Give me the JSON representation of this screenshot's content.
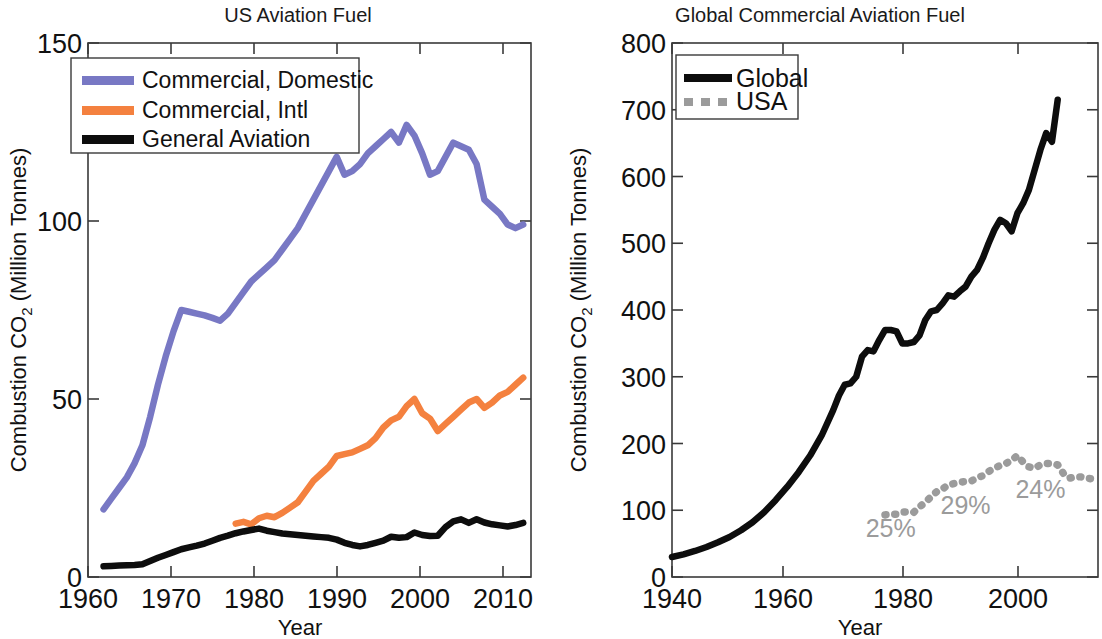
{
  "chart_data": [
    {
      "type": "line",
      "id": "us-aviation-fuel",
      "title": "US Aviation Fuel",
      "xlabel": "Year",
      "ylabel_main": "Combustion CO",
      "ylabel_sub": "2",
      "ylabel_tail": " (Million Tonnes)",
      "ylabel_full": "Combustion CO2 (Million Tonnes)",
      "xlim": [
        1958,
        2015
      ],
      "ylim": [
        0,
        150
      ],
      "xticks": [
        1960,
        1970,
        1980,
        1990,
        2000,
        2010
      ],
      "xticklabels": [
        "1960",
        "1970",
        "1980",
        "1990",
        "2000",
        "2010"
      ],
      "yticks": [
        0,
        50,
        100,
        150
      ],
      "yticklabels": [
        "0",
        "50",
        "100",
        "150"
      ],
      "grid": false,
      "legend_position": "top-left",
      "series": [
        {
          "name": "Commercial, Domestic",
          "color": "#7878c4",
          "style": "solid",
          "x": [
            1960,
            1961,
            1962,
            1963,
            1964,
            1965,
            1966,
            1967,
            1968,
            1969,
            1970,
            1971,
            1972,
            1973,
            1974,
            1975,
            1976,
            1977,
            1978,
            1979,
            1980,
            1981,
            1982,
            1983,
            1984,
            1985,
            1986,
            1987,
            1988,
            1989,
            1990,
            1991,
            1992,
            1993,
            1994,
            1995,
            1996,
            1997,
            1998,
            1999,
            2000,
            2001,
            2002,
            2003,
            2004,
            2005,
            2006,
            2007,
            2008,
            2009,
            2010,
            2011,
            2012,
            2013,
            2014
          ],
          "values": [
            19,
            22,
            25,
            28,
            32,
            37,
            45,
            54,
            62,
            69,
            75,
            74.5,
            74,
            73.5,
            72.8,
            72,
            74,
            77,
            80,
            83,
            85,
            87,
            89,
            92,
            95,
            98,
            102,
            106,
            110,
            114,
            118,
            113,
            114,
            116,
            119,
            121,
            123,
            125,
            122,
            127,
            124,
            119,
            113,
            114,
            118,
            122,
            121,
            120,
            116,
            106,
            104,
            102,
            99,
            98,
            99
          ]
        },
        {
          "name": "Commercial, Intl",
          "color": "#f4813f",
          "style": "solid",
          "x": [
            1977,
            1978,
            1979,
            1980,
            1981,
            1982,
            1983,
            1984,
            1985,
            1986,
            1987,
            1988,
            1989,
            1990,
            1991,
            1992,
            1993,
            1994,
            1995,
            1996,
            1997,
            1998,
            1999,
            2000,
            2001,
            2002,
            2003,
            2004,
            2005,
            2006,
            2007,
            2008,
            2009,
            2010,
            2011,
            2012,
            2013,
            2014
          ],
          "values": [
            15,
            15.5,
            14.8,
            16.5,
            17.2,
            16.8,
            18,
            19.5,
            21,
            24,
            27,
            29,
            31,
            34,
            34.5,
            35,
            36,
            37,
            39,
            42,
            44,
            45,
            48,
            50,
            46,
            44.5,
            41,
            43,
            45,
            47,
            49,
            50,
            47.5,
            49,
            51,
            52,
            54,
            56
          ]
        },
        {
          "name": "General Aviation",
          "color": "#0d0d0d",
          "style": "solid",
          "x": [
            1960,
            1961,
            1962,
            1963,
            1964,
            1965,
            1966,
            1967,
            1968,
            1969,
            1970,
            1971,
            1972,
            1973,
            1974,
            1975,
            1976,
            1977,
            1978,
            1979,
            1980,
            1981,
            1982,
            1983,
            1984,
            1985,
            1986,
            1987,
            1988,
            1989,
            1990,
            1991,
            1992,
            1993,
            1994,
            1995,
            1996,
            1997,
            1998,
            1999,
            2000,
            2001,
            2002,
            2003,
            2004,
            2005,
            2006,
            2007,
            2008,
            2009,
            2010,
            2011,
            2012,
            2013,
            2014
          ],
          "values": [
            3,
            3.1,
            3.2,
            3.3,
            3.4,
            3.6,
            4.5,
            5.4,
            6.2,
            7,
            7.8,
            8.3,
            8.8,
            9.4,
            10.2,
            11,
            11.6,
            12.3,
            12.8,
            13.2,
            13.6,
            13.0,
            12.6,
            12.2,
            12.0,
            11.8,
            11.6,
            11.4,
            11.2,
            11.0,
            10.5,
            9.6,
            9.0,
            8.6,
            9.0,
            9.6,
            10.2,
            11.3,
            11.0,
            11.2,
            12.5,
            11.8,
            11.5,
            11.6,
            14.0,
            15.6,
            16.2,
            15.2,
            16.2,
            15.3,
            14.8,
            14.5,
            14.2,
            14.6,
            15.2
          ]
        }
      ]
    },
    {
      "type": "line",
      "id": "global-commercial-aviation-fuel",
      "title": "Global Commercial Aviation Fuel",
      "xlabel": "Year",
      "ylabel_main": "Combustion CO",
      "ylabel_sub": "2",
      "ylabel_tail": " (Million Tonnes)",
      "ylabel_full": "Combustion CO2 (Million Tonnes)",
      "xlim": [
        1940,
        2014
      ],
      "ylim": [
        0,
        800
      ],
      "xticks": [
        1940,
        1960,
        1980,
        2000
      ],
      "xticklabels": [
        "1940",
        "1960",
        "1980",
        "2000"
      ],
      "yticks": [
        0,
        100,
        200,
        300,
        400,
        500,
        600,
        700,
        800
      ],
      "yticklabels": [
        "0",
        "100",
        "200",
        "300",
        "400",
        "500",
        "600",
        "700",
        "800"
      ],
      "grid": false,
      "legend_position": "top-left",
      "annotations": [
        {
          "text": "25%",
          "x": 1978,
          "y": 60
        },
        {
          "text": "29%",
          "x": 1991,
          "y": 95
        },
        {
          "text": "24%",
          "x": 2004,
          "y": 118
        }
      ],
      "series": [
        {
          "name": "Global",
          "color": "#0d0d0d",
          "style": "solid",
          "x": [
            1940,
            1942,
            1944,
            1946,
            1948,
            1950,
            1952,
            1954,
            1956,
            1958,
            1960,
            1962,
            1964,
            1966,
            1968,
            1969,
            1970,
            1971,
            1972,
            1973,
            1974,
            1975,
            1976,
            1977,
            1978,
            1979,
            1980,
            1981,
            1982,
            1983,
            1984,
            1985,
            1986,
            1987,
            1988,
            1989,
            1990,
            1991,
            1992,
            1993,
            1994,
            1995,
            1996,
            1997,
            1998,
            1999,
            2000,
            2001,
            2002,
            2003,
            2004,
            2005,
            2006,
            2007
          ],
          "values": [
            30,
            34,
            39,
            45,
            52,
            60,
            70,
            82,
            97,
            115,
            135,
            157,
            182,
            212,
            250,
            272,
            288,
            290,
            300,
            330,
            340,
            338,
            355,
            370,
            370,
            368,
            350,
            350,
            352,
            362,
            385,
            398,
            400,
            410,
            422,
            420,
            428,
            435,
            450,
            460,
            478,
            500,
            520,
            535,
            530,
            518,
            545,
            560,
            580,
            610,
            640,
            665,
            652,
            715
          ]
        },
        {
          "name": "USA",
          "color": "#9b9b9b",
          "style": "dashed",
          "x": [
            1977,
            1978,
            1979,
            1980,
            1981,
            1982,
            1983,
            1984,
            1985,
            1986,
            1987,
            1988,
            1989,
            1990,
            1991,
            1992,
            1993,
            1994,
            1995,
            1996,
            1997,
            1998,
            1999,
            2000,
            2001,
            2002,
            2003,
            2004,
            2005,
            2006,
            2007,
            2008,
            2009,
            2010,
            2011,
            2012,
            2013,
            2014
          ],
          "values": [
            93,
            94,
            94,
            97,
            98,
            97,
            105,
            112,
            120,
            128,
            132,
            138,
            140,
            142,
            143,
            144,
            148,
            152,
            158,
            163,
            167,
            170,
            175,
            182,
            172,
            165,
            163,
            168,
            170,
            170,
            168,
            155,
            148,
            150,
            150,
            148,
            147,
            148
          ]
        }
      ]
    }
  ]
}
